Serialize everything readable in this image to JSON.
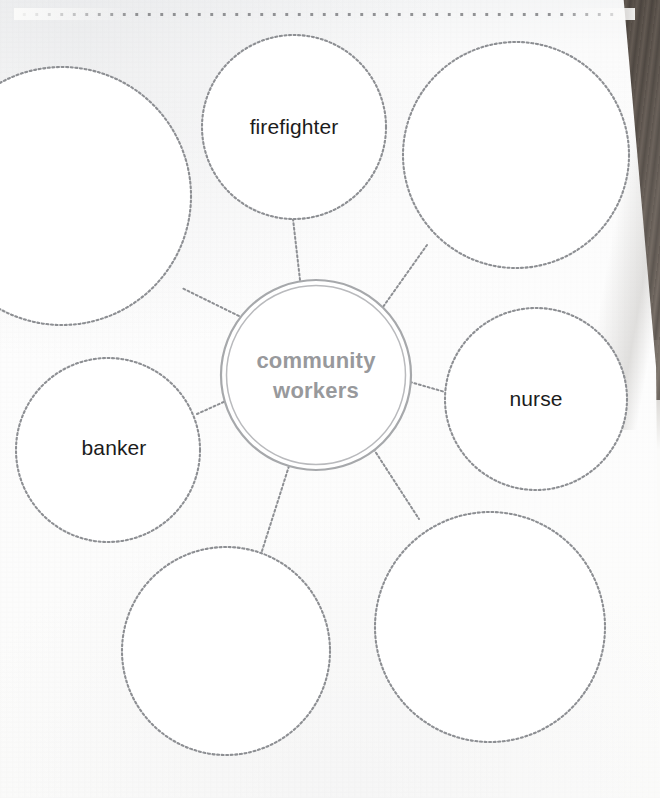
{
  "worksheet": {
    "kind": "bubble-map-graphic-organizer",
    "hub": {
      "label_line1": "community",
      "label_line2": "workers",
      "text_color": "#98999c",
      "cx": 316,
      "cy": 375,
      "r": 95
    },
    "bubbles": [
      {
        "id": "top-left",
        "label": "",
        "cx": 62,
        "cy": 196,
        "r": 129,
        "clipped": true
      },
      {
        "id": "firefighter",
        "label": "firefighter",
        "cx": 294,
        "cy": 127,
        "r": 92,
        "clipped": false
      },
      {
        "id": "top-right",
        "label": "",
        "cx": 516,
        "cy": 155,
        "r": 113,
        "clipped": false
      },
      {
        "id": "nurse",
        "label": "nurse",
        "cx": 536,
        "cy": 399,
        "r": 91,
        "clipped": false
      },
      {
        "id": "bottom-right",
        "label": "",
        "cx": 490,
        "cy": 627,
        "r": 115,
        "clipped": false
      },
      {
        "id": "bottom-left",
        "label": "",
        "cx": 226,
        "cy": 651,
        "r": 104,
        "clipped": false
      },
      {
        "id": "banker",
        "label": "banker",
        "cx": 108,
        "cy": 450,
        "r": 92,
        "clipped": false
      }
    ],
    "spokes": [
      {
        "from": "hub",
        "to": "top-left"
      },
      {
        "from": "hub",
        "to": "firefighter"
      },
      {
        "from": "hub",
        "to": "top-right"
      },
      {
        "from": "hub",
        "to": "nurse"
      },
      {
        "from": "hub",
        "to": "bottom-right"
      },
      {
        "from": "hub",
        "to": "bottom-left"
      },
      {
        "from": "hub",
        "to": "banker"
      }
    ],
    "style": {
      "bubble_stroke": "#8d8f93",
      "bubble_fill": "#ffffff",
      "hub_stroke": "#a6a8ab",
      "label_color": "#1c1c1c",
      "paper_color": "#fbfbfa",
      "desk_color": "#5c5249"
    },
    "paper": {
      "perforation_row": true,
      "torn_edge_side": "right"
    }
  }
}
